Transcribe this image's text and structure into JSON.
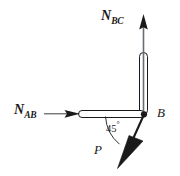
{
  "diagram": {
    "type": "free-body-diagram",
    "background_color": "#ffffff",
    "stroke_color": "#1a1a1a",
    "member_fill_color": "#ffffff",
    "labels": {
      "force_bc": {
        "symbol": "N",
        "subscript": "BC"
      },
      "force_ab": {
        "symbol": "N",
        "subscript": "AB"
      },
      "force_p": {
        "symbol": "P"
      },
      "joint_b": {
        "symbol": "B"
      },
      "angle": {
        "value": "45",
        "unit": "°"
      }
    },
    "members": [
      {
        "name": "member-bc",
        "orientation": "vertical"
      },
      {
        "name": "member-ab",
        "orientation": "horizontal"
      }
    ],
    "forces": [
      {
        "name": "force-bc-arrow",
        "direction": "up",
        "angle_deg": 90
      },
      {
        "name": "force-ab-arrow",
        "direction": "right",
        "angle_deg": 0
      },
      {
        "name": "force-p-arrow",
        "direction": "down-left",
        "angle_deg": 225
      }
    ]
  }
}
